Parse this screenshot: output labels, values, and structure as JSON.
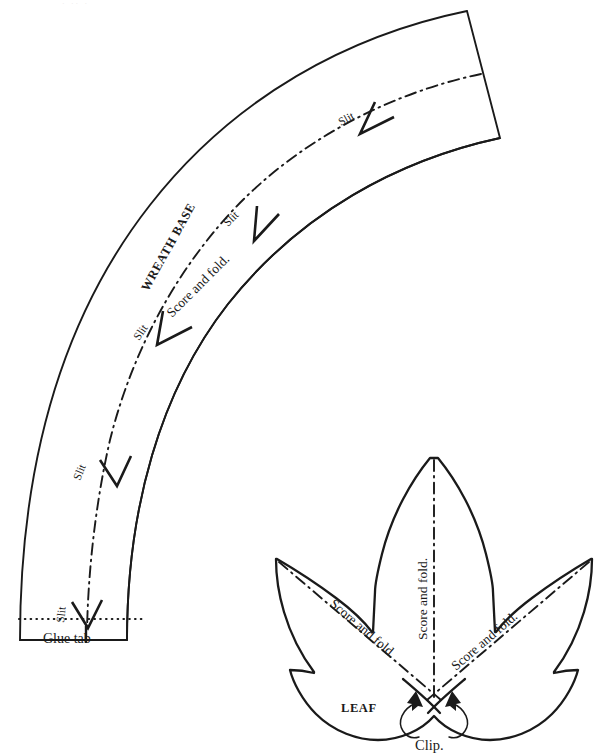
{
  "page": {
    "background_color": "#ffffff",
    "ink_color": "#1a1a1a",
    "width": 594,
    "height": 755,
    "faint_header_artifact": "· ·· ·"
  },
  "wreath": {
    "title": "WREATH BASE",
    "score_fold_label": "Score and fold.",
    "slit_labels": [
      {
        "id": "slit-1",
        "text": "Slit"
      },
      {
        "id": "slit-2",
        "text": "Slit"
      },
      {
        "id": "slit-3",
        "text": "Slit"
      },
      {
        "id": "slit-4",
        "text": "Slit"
      },
      {
        "id": "slit-5",
        "text": "Slit"
      }
    ],
    "glue_tab_label": "Glue tab"
  },
  "leaf": {
    "title": "LEAF",
    "score_fold_labels": [
      {
        "id": "leaf-score-left",
        "text": "Score and fold."
      },
      {
        "id": "leaf-score-center",
        "text": "Score and fold."
      },
      {
        "id": "leaf-score-right",
        "text": "Score and fold."
      }
    ],
    "clip_label": "Clip."
  }
}
